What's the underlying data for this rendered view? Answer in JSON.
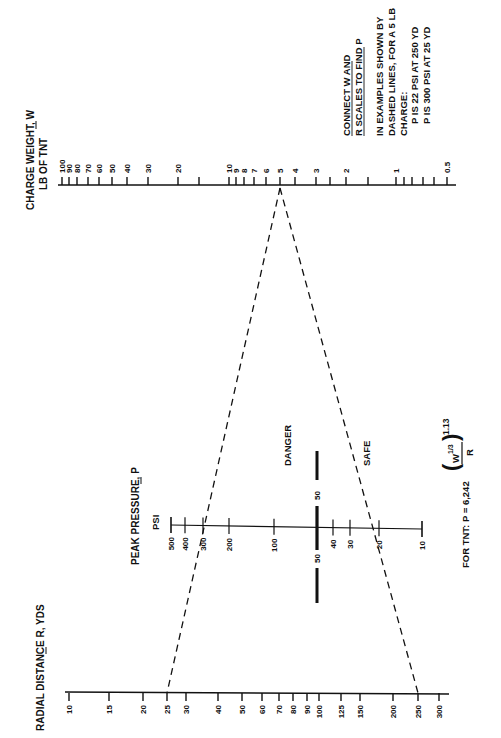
{
  "scales": {
    "charge_weight": {
      "title_line1": "CHARGE WEIGHT, W",
      "title_line2": "LB OF TNT",
      "underlined_symbol": "W",
      "axis_y": 185,
      "x_start": 58,
      "x_end": 456,
      "ticks": [
        {
          "label": "100",
          "x": 62
        },
        {
          "label": "90",
          "x": 69
        },
        {
          "label": "80",
          "x": 77
        },
        {
          "label": "70",
          "x": 88
        },
        {
          "label": "60",
          "x": 99
        },
        {
          "label": "50",
          "x": 112
        },
        {
          "label": "40",
          "x": 127
        },
        {
          "label": "30",
          "x": 148
        },
        {
          "label": "20",
          "x": 178
        },
        {
          "label": "",
          "x": 199
        },
        {
          "label": "10",
          "x": 229
        },
        {
          "label": "9",
          "x": 236
        },
        {
          "label": "8",
          "x": 244
        },
        {
          "label": "7",
          "x": 254
        },
        {
          "label": "6",
          "x": 266
        },
        {
          "label": "5",
          "x": 280
        },
        {
          "label": "4",
          "x": 295
        },
        {
          "label": "3",
          "x": 316
        },
        {
          "label": "",
          "x": 330
        },
        {
          "label": "2",
          "x": 346
        },
        {
          "label": "",
          "x": 368
        },
        {
          "label": "1",
          "x": 396
        },
        {
          "label": "",
          "x": 404
        },
        {
          "label": "",
          "x": 412
        },
        {
          "label": "",
          "x": 423
        },
        {
          "label": "",
          "x": 434
        },
        {
          "label": "0.5",
          "x": 447
        }
      ]
    },
    "peak_pressure": {
      "title": "PEAK PRESSURE, P",
      "unit": "PSI",
      "axis_y": 527,
      "x_start": 171,
      "x_end": 422,
      "ticks": [
        {
          "label": "500",
          "x": 171
        },
        {
          "label": "400",
          "x": 185
        },
        {
          "label": "300",
          "x": 203
        },
        {
          "label": "200",
          "x": 229
        },
        {
          "label": "100",
          "x": 274
        },
        {
          "label": "50",
          "x": 317
        },
        {
          "label": "40",
          "x": 333
        },
        {
          "label": "30",
          "x": 350
        },
        {
          "label": "20",
          "x": 379
        },
        {
          "label": "10",
          "x": 422
        }
      ],
      "threshold": {
        "value_label_top": "50",
        "value_label_bottom": "50",
        "danger_label": "DANGER",
        "safe_label": "SAFE",
        "x": 317
      }
    },
    "radial_distance": {
      "title": "RADIAL DISTANCE R, YDS",
      "underlined_symbol": "R",
      "axis_y": 693,
      "x_start": 65,
      "x_end": 449,
      "ticks": [
        {
          "label": "10",
          "x": 69
        },
        {
          "label": "15",
          "x": 109
        },
        {
          "label": "20",
          "x": 143
        },
        {
          "label": "25",
          "x": 167
        },
        {
          "label": "30",
          "x": 186
        },
        {
          "label": "40",
          "x": 218
        },
        {
          "label": "50",
          "x": 242
        },
        {
          "label": "60",
          "x": 262
        },
        {
          "label": "70",
          "x": 279
        },
        {
          "label": "80",
          "x": 293
        },
        {
          "label": "90",
          "x": 307
        },
        {
          "label": "100",
          "x": 319
        },
        {
          "label": "125",
          "x": 341
        },
        {
          "label": "150",
          "x": 360
        },
        {
          "label": "200",
          "x": 393
        },
        {
          "label": "250",
          "x": 418
        },
        {
          "label": "300",
          "x": 439
        }
      ]
    }
  },
  "instructions": {
    "line1": "CONNECT W AND",
    "line2": "R SCALES TO FIND P",
    "example_line1": "IN EXAMPLES SHOWN BY",
    "example_line2": "DASHED LINES, FOR A 5 LB",
    "example_line3": "CHARGE:",
    "example_result1": "P IS 22 PSI AT  250 YD",
    "example_result2": "P IS 300 PSI AT 25 YD"
  },
  "formula": {
    "prefix": "FOR TNT:  P = 6,242",
    "numerator": "W",
    "numerator_exp": "1/3",
    "denominator": "R",
    "exponent": "1.13"
  },
  "examples": [
    {
      "W": "5",
      "R": "25",
      "P": "300",
      "from_x": 280,
      "to_x": 167
    },
    {
      "W": "5",
      "R": "250",
      "P": "22",
      "from_x": 280,
      "to_x": 418
    }
  ]
}
